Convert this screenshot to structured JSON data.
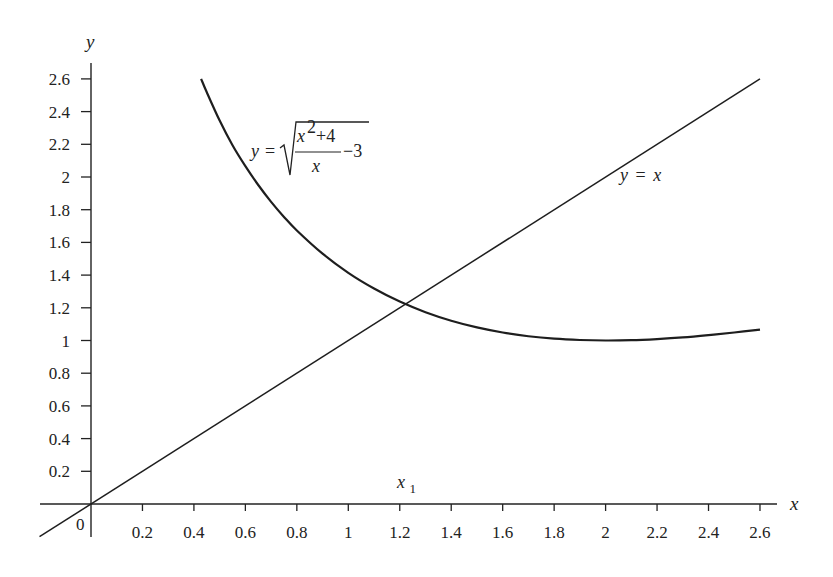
{
  "chart_data": {
    "type": "line",
    "title": "",
    "xlabel": "x",
    "ylabel": "y",
    "xlim": [
      -0.2,
      2.67
    ],
    "ylim": [
      -0.2,
      2.72
    ],
    "grid": false,
    "legend": "none",
    "origin_label": "0",
    "x_ticks": [
      0.2,
      0.4,
      0.6,
      0.8,
      1,
      1.2,
      1.4,
      1.6,
      1.8,
      2,
      2.2,
      2.4,
      2.6
    ],
    "x_tick_labels": [
      "0.2",
      "0.4",
      "0.6",
      "0.8",
      "1",
      "1.2",
      "1.4",
      "1.6",
      "1.8",
      "2",
      "2.2",
      "2.4",
      "2.6"
    ],
    "y_ticks": [
      0.2,
      0.4,
      0.6,
      0.8,
      1,
      1.2,
      1.4,
      1.6,
      1.8,
      2,
      2.2,
      2.4,
      2.6
    ],
    "y_tick_labels": [
      "0.2",
      "0.4",
      "0.6",
      "0.8",
      "1",
      "1.2",
      "1.4",
      "1.6",
      "1.8",
      "2",
      "2.2",
      "2.4",
      "2.6"
    ],
    "series": [
      {
        "name": "y = sqrt((x^2+4)/x - 3)",
        "x": [
          0.428,
          0.45,
          0.5,
          0.55,
          0.6,
          0.65,
          0.7,
          0.75,
          0.8,
          0.9,
          1.0,
          1.1,
          1.2,
          1.3,
          1.4,
          1.5,
          1.6,
          1.7,
          1.8,
          1.9,
          2.0,
          2.1,
          2.2,
          2.3,
          2.4,
          2.5,
          2.6
        ],
        "y": [
          2.6,
          2.518,
          2.345,
          2.194,
          2.066,
          1.951,
          1.848,
          1.756,
          1.673,
          1.531,
          1.414,
          1.318,
          1.238,
          1.173,
          1.121,
          1.08,
          1.049,
          1.026,
          1.011,
          1.003,
          1.0,
          1.002,
          1.009,
          1.019,
          1.033,
          1.049,
          1.067
        ]
      },
      {
        "name": "y = x",
        "x": [
          -0.2,
          2.6
        ],
        "y": [
          -0.2,
          2.6
        ]
      }
    ],
    "annotations": [
      {
        "text": "y = √((x²+4)/x − 3)",
        "x": 0.62,
        "y": 2.0
      },
      {
        "text": "y = x",
        "x": 2.05,
        "y": 2.0
      },
      {
        "text": "x₁",
        "x": 1.21,
        "y": 0.12
      }
    ]
  },
  "labels": {
    "x_axis": "x",
    "y_axis": "y",
    "origin": "0",
    "line_label_y": "y",
    "line_label_eq": "=",
    "line_label_x": "x",
    "curve_y": "y",
    "curve_eq": "=",
    "curve_num_x": "x",
    "curve_num_exp": "2",
    "curve_num_rest": "+4",
    "curve_den": "x",
    "curve_minus3": "−3",
    "x1_main": "x",
    "x1_sub": "1"
  }
}
